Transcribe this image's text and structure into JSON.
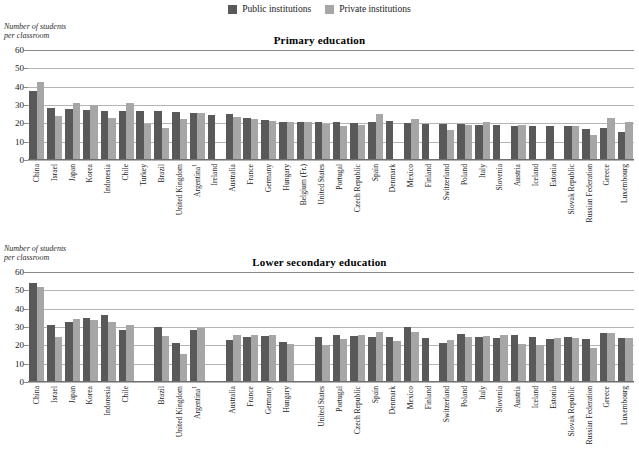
{
  "legend": {
    "items": [
      {
        "label": "Public institutions",
        "color": "#595959",
        "key": "public"
      },
      {
        "label": "Private institutions",
        "color": "#a6a6a6",
        "key": "private"
      }
    ]
  },
  "axis_caption": "Number of students\nper classroom",
  "chart_data": [
    {
      "type": "bar",
      "title": "Primary education",
      "ylabel": "Number of students per classroom",
      "xlabel": "",
      "ylim": [
        0,
        60
      ],
      "yticks": [
        0,
        10,
        20,
        30,
        40,
        50,
        60
      ],
      "grid": true,
      "legend_position": "top-center",
      "categories": [
        "China",
        "Israel",
        "Japan",
        "Korea",
        "Indonesia",
        "Chile",
        "Turkey",
        "Brazil",
        "United Kingdom",
        "Argentina¹",
        "Ireland",
        "Australia",
        "France",
        "Germany",
        "Hungary",
        "Belgium (Fr.)",
        "United States",
        "Portugal",
        "Czech Republic",
        "Spain",
        "Denmark",
        "Mexico",
        "Finland",
        "Switzerland",
        "Poland",
        "Italy",
        "Slovenia",
        "Austria",
        "Iceland",
        "Estonia",
        "Slovak Republic",
        "Russian Federation",
        "Greece",
        "Luxembourg"
      ],
      "series": [
        {
          "name": "Public institutions",
          "values": [
            37.5,
            28.5,
            27.8,
            27.5,
            27.0,
            27.0,
            26.5,
            26.5,
            26.0,
            25.5,
            24.5,
            25.0,
            23.0,
            22.0,
            21.0,
            20.5,
            20.5,
            21.0,
            20.0,
            21.0,
            21.5,
            20.0,
            19.5,
            19.5,
            19.5,
            19.0,
            19.0,
            18.5,
            18.5,
            18.5,
            18.5,
            17.0,
            17.5,
            15.5
          ]
        },
        {
          "name": "Private institutions",
          "values": [
            42.5,
            24.0,
            31.0,
            30.0,
            23.0,
            31.0,
            19.5,
            17.5,
            22.5,
            25.5,
            null,
            23.5,
            22.5,
            21.5,
            20.5,
            20.5,
            19.5,
            18.5,
            19.0,
            25.0,
            null,
            22.5,
            null,
            16.5,
            19.0,
            20.5,
            null,
            19.0,
            null,
            null,
            18.5,
            13.5,
            23.0,
            20.5
          ]
        }
      ]
    },
    {
      "type": "bar",
      "title": "Lower secondary education",
      "ylabel": "Number of students per classroom",
      "xlabel": "",
      "ylim": [
        0,
        60
      ],
      "yticks": [
        0,
        10,
        20,
        30,
        40,
        50,
        60
      ],
      "grid": true,
      "legend_position": "top-center",
      "categories": [
        "China",
        "Israel",
        "Japan",
        "Korea",
        "Indonesia",
        "Chile",
        "",
        "Brazil",
        "United Kingdom",
        "Argentina¹",
        "",
        "Australia",
        "France",
        "Germany",
        "Hungary",
        "",
        "United States",
        "Portugal",
        "Czech Republic",
        "Spain",
        "Denmark",
        "Mexico",
        "Finland",
        "Switzerland",
        "Poland",
        "Italy",
        "Slovenia",
        "Austria",
        "Iceland",
        "Estonia",
        "Slovak Republic",
        "Russian Federation",
        "Greece",
        "Luxembourg"
      ],
      "series": [
        {
          "name": "Public institutions",
          "values": [
            54.0,
            31.0,
            32.5,
            35.0,
            36.5,
            28.5,
            null,
            30.0,
            21.5,
            28.5,
            null,
            23.0,
            24.5,
            25.0,
            22.0,
            null,
            24.5,
            25.5,
            25.0,
            24.5,
            24.5,
            30.0,
            24.0,
            21.5,
            26.0,
            24.5,
            24.0,
            25.5,
            24.5,
            23.5,
            24.5,
            23.5,
            26.5,
            24.0
          ]
        },
        {
          "name": "Private institutions",
          "values": [
            52.0,
            24.5,
            34.5,
            34.0,
            32.5,
            31.0,
            null,
            25.0,
            15.5,
            29.5,
            null,
            25.5,
            25.5,
            25.5,
            21.0,
            null,
            20.0,
            23.5,
            25.5,
            27.5,
            22.5,
            27.5,
            null,
            23.0,
            24.5,
            25.0,
            25.5,
            20.5,
            20.0,
            24.0,
            24.0,
            18.5,
            27.0,
            24.0
          ]
        }
      ]
    }
  ]
}
